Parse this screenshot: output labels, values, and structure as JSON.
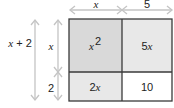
{
  "diagram": {
    "type": "area-model",
    "top_dimensions": [
      {
        "label": "x",
        "italic": true
      },
      {
        "label": "5",
        "italic": false
      }
    ],
    "left_outer_dimension": {
      "label_var": "x",
      "label_rest": " + 2"
    },
    "left_inner_dimensions": [
      {
        "label": "x",
        "italic": true
      },
      {
        "label": "2",
        "italic": false
      }
    ],
    "cells": {
      "top_left": {
        "coef": "",
        "var": "x",
        "exp": "2",
        "fill": "#d9d9d9"
      },
      "top_right": {
        "coef": "5",
        "var": "x",
        "exp": "",
        "fill": "#e8e8e8"
      },
      "bottom_left": {
        "coef": "2",
        "var": "x",
        "exp": "",
        "fill": "#e8e8e8"
      },
      "bottom_right": {
        "coef": "10",
        "var": "",
        "exp": "",
        "fill": "#ffffff"
      }
    },
    "colors": {
      "border": "#3a3a3a",
      "arrow": "#c4c4c4",
      "text": "#222222"
    }
  }
}
